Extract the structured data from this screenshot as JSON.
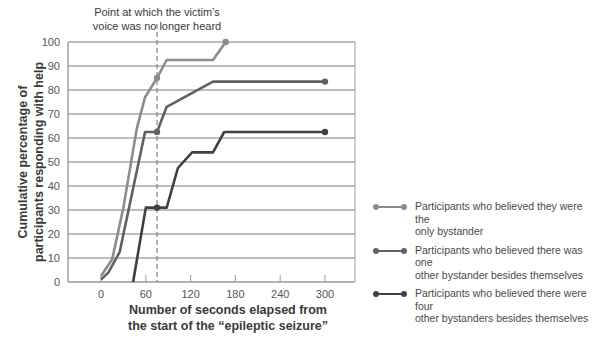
{
  "chart_data": {
    "type": "line",
    "title": "",
    "xlabel": "Number of seconds elapsed from the start of the “epileptic seizure”",
    "xlabel_lines": [
      "Number of seconds elapsed from",
      "the start of the “epileptic seizure”"
    ],
    "ylabel": "Cumulative percentage of participants responding with help",
    "ylabel_lines": [
      "Cumulative percentage of",
      "participants responding with help"
    ],
    "xlim": [
      -45,
      340
    ],
    "ylim": [
      0,
      100
    ],
    "xticks": [
      0,
      60,
      120,
      180,
      240,
      300
    ],
    "yticks": [
      0,
      10,
      20,
      30,
      40,
      50,
      60,
      70,
      80,
      90,
      100
    ],
    "grid": "horizontal",
    "legend_position": "right",
    "annotation": {
      "text_lines": [
        "Point at which the victim’s",
        "voice was no longer heard"
      ],
      "x": 75
    },
    "series": [
      {
        "name": "Participants who believed they were the only bystander",
        "color": "#8c8c8c",
        "points": [
          [
            0,
            2.5
          ],
          [
            15,
            9.5
          ],
          [
            30,
            31
          ],
          [
            48,
            64
          ],
          [
            59,
            77
          ],
          [
            75,
            85
          ],
          [
            88,
            92.5
          ],
          [
            150,
            92.5
          ],
          [
            167,
            100
          ]
        ],
        "markers": [
          [
            75,
            85
          ],
          [
            167,
            100
          ]
        ]
      },
      {
        "name": "Participants who believed there was one other bystander besides themselves",
        "color": "#616161",
        "points": [
          [
            0,
            1
          ],
          [
            10,
            4
          ],
          [
            25,
            12.5
          ],
          [
            59,
            62.5
          ],
          [
            75,
            62.5
          ],
          [
            88,
            73
          ],
          [
            150,
            83.5
          ],
          [
            300,
            83.5
          ]
        ],
        "markers": [
          [
            75,
            62.5
          ],
          [
            300,
            83.5
          ]
        ]
      },
      {
        "name": "Participants who believed there were four other bystanders besides themselves",
        "color": "#404040",
        "points": [
          [
            43,
            0
          ],
          [
            60,
            31
          ],
          [
            88,
            31
          ],
          [
            103,
            47.5
          ],
          [
            122,
            54
          ],
          [
            150,
            54
          ],
          [
            165,
            62.5
          ],
          [
            300,
            62.5
          ]
        ],
        "markers": [
          [
            75,
            31
          ],
          [
            300,
            62.5
          ]
        ]
      }
    ]
  },
  "legend": {
    "items": [
      {
        "lines": [
          "Participants who believed they were the",
          "only bystander"
        ],
        "color": "#8c8c8c"
      },
      {
        "lines": [
          "Participants who believed there was one",
          "other bystander besides themselves"
        ],
        "color": "#616161"
      },
      {
        "lines": [
          "Participants who believed there were four",
          "other bystanders besides themselves"
        ],
        "color": "#404040"
      }
    ]
  },
  "style": {
    "grid_color": "#a9a9a9",
    "frame_color": "#9a9a9a",
    "dash_color": "#6a6a6a"
  }
}
